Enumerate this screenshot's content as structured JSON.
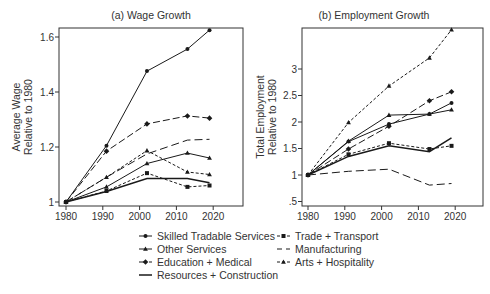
{
  "chart_data": [
    {
      "type": "line",
      "title": "(a) Wage Growth",
      "xlabel": "",
      "ylabel": "Average Wage Relative to 1980",
      "ylabel_lines": [
        "Average Wage",
        "Relative to 1980"
      ],
      "xlim": [
        1978,
        2027
      ],
      "ylim": [
        0.99,
        1.63
      ],
      "xticks": [
        1980,
        1990,
        2000,
        2010,
        2020
      ],
      "yticks": [
        1,
        1.2,
        1.4,
        1.6
      ],
      "ytick_labels": [
        "1",
        "1.2",
        "1.4",
        "1.6"
      ],
      "grid": false,
      "x": [
        1980,
        1991,
        2002,
        2013,
        2019
      ],
      "series": [
        {
          "name": "Skilled Tradable Services",
          "values": [
            1.0,
            1.205,
            1.476,
            1.556,
            1.625
          ]
        },
        {
          "name": "Other Services",
          "values": [
            1.0,
            1.055,
            1.14,
            1.178,
            1.16
          ]
        },
        {
          "name": "Education + Medical",
          "values": [
            1.0,
            1.185,
            1.284,
            1.313,
            1.305
          ]
        },
        {
          "name": "Resources + Construction",
          "values": [
            1.0,
            1.038,
            1.085,
            1.085,
            1.07
          ]
        },
        {
          "name": "Trade + Transport",
          "values": [
            1.0,
            1.04,
            1.105,
            1.055,
            1.06
          ]
        },
        {
          "name": "Manufacturing",
          "values": [
            1.0,
            1.09,
            1.175,
            1.225,
            1.228
          ]
        },
        {
          "name": "Arts + Hospitality",
          "values": [
            1.0,
            1.09,
            1.187,
            1.109,
            1.1
          ]
        }
      ]
    },
    {
      "type": "line",
      "title": "(b) Employment Growth",
      "xlabel": "",
      "ylabel": "Total Employment Relative to 1980",
      "ylabel_lines": [
        "Total Employment",
        "Relative to 1980"
      ],
      "xlim": [
        1978,
        2027
      ],
      "ylim": [
        0.45,
        3.8
      ],
      "xticks": [
        1980,
        1990,
        2000,
        2010,
        2020
      ],
      "yticks": [
        0.5,
        1,
        1.5,
        2,
        2.5,
        3
      ],
      "ytick_labels": [
        ".5",
        "1",
        "1.5",
        "2",
        "2.5",
        "3"
      ],
      "grid": false,
      "x": [
        1980,
        1991,
        2002,
        2013,
        2019
      ],
      "series": [
        {
          "name": "Skilled Tradable Services",
          "values": [
            1.0,
            1.63,
            1.96,
            2.15,
            2.36
          ]
        },
        {
          "name": "Other Services",
          "values": [
            1.0,
            1.64,
            2.13,
            2.15,
            2.23
          ]
        },
        {
          "name": "Education + Medical",
          "values": [
            1.0,
            1.49,
            1.92,
            2.4,
            2.57
          ]
        },
        {
          "name": "Resources + Construction",
          "values": [
            1.0,
            1.35,
            1.55,
            1.44,
            1.7
          ]
        },
        {
          "name": "Trade + Transport",
          "values": [
            1.0,
            1.39,
            1.6,
            1.49,
            1.55
          ]
        },
        {
          "name": "Manufacturing",
          "values": [
            1.0,
            1.07,
            1.11,
            0.81,
            0.84
          ]
        },
        {
          "name": "Arts + Hospitality",
          "values": [
            1.0,
            1.99,
            2.68,
            3.21,
            3.74
          ]
        }
      ]
    }
  ],
  "legend": {
    "position": "bottom",
    "entries": [
      {
        "label": "Skilled Tradable Services",
        "marker": "circle",
        "line": "solid"
      },
      {
        "label": "Trade + Transport",
        "marker": "square",
        "line": "shortdash"
      },
      {
        "label": "Other Services",
        "marker": "triangle",
        "line": "solid"
      },
      {
        "label": "Manufacturing",
        "marker": "none",
        "line": "longdash"
      },
      {
        "label": "Education + Medical",
        "marker": "diamond",
        "line": "longdash"
      },
      {
        "label": "Arts + Hospitality",
        "marker": "triangle",
        "line": "shortdash"
      },
      {
        "label": "Resources + Construction",
        "marker": "none",
        "line": "solid"
      }
    ]
  },
  "colors": {
    "line": "#1a1a1a",
    "axis": "#333333",
    "text": "#333333",
    "background": "#ffffff"
  }
}
